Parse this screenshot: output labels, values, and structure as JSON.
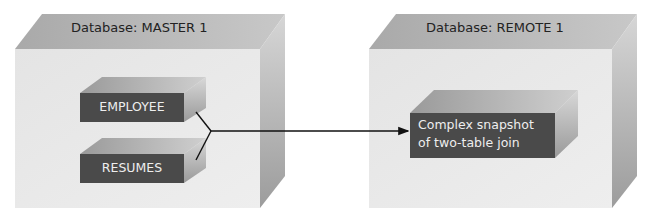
{
  "databases": [
    {
      "label": "Database: MASTER 1",
      "tables": [
        {
          "label": "EMPLOYEE"
        },
        {
          "label": "RESUMES"
        }
      ]
    },
    {
      "label": "Database: REMOTE 1",
      "snapshot": {
        "line1": "Complex snapshot",
        "line2": "of two-table join"
      }
    }
  ],
  "colors": {
    "box_front": "#e6e6e6",
    "box_top": "#b4b4b4",
    "box_side": "#a8a8a8",
    "table_front": "#4a4a4a",
    "table_top": "#a6a6a6",
    "table_side": "#bdbdbd",
    "arrow": "#111111"
  }
}
